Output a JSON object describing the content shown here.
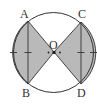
{
  "diagram": {
    "type": "circle-with-shaded-segments",
    "colors": {
      "background": "#ffffff",
      "stroke": "#333333",
      "shade": "#b9b9b9"
    },
    "circle": {
      "cx": 53.5,
      "cy": 52.5,
      "r": 40
    },
    "points": {
      "A": {
        "label": "A",
        "x": 28,
        "y": 21
      },
      "B": {
        "label": "B",
        "x": 28,
        "y": 84
      },
      "C": {
        "label": "C",
        "x": 81,
        "y": 22
      },
      "D": {
        "label": "D",
        "x": 81,
        "y": 84
      },
      "O": {
        "label": "O",
        "x": 54,
        "y": 52
      }
    }
  }
}
